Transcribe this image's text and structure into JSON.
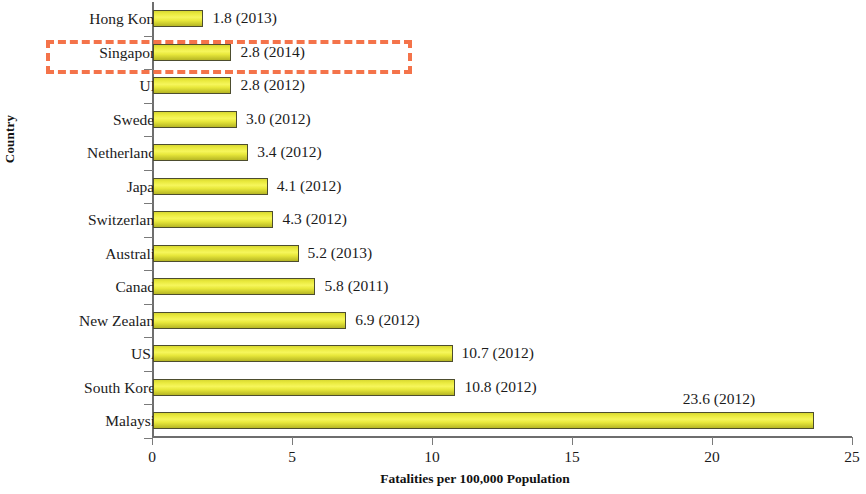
{
  "chart_data": {
    "type": "bar",
    "orientation": "horizontal",
    "title": "",
    "xlabel": "Fatalities per 100,000 Population",
    "ylabel": "Country",
    "xlim": [
      0,
      25
    ],
    "xticks": [
      0,
      5,
      10,
      15,
      20,
      25
    ],
    "xtick_labels": [
      "0",
      "5",
      "10",
      "15",
      "20",
      "25"
    ],
    "grid": false,
    "legend": false,
    "bar_color": "#eaea3e",
    "bar_edge_color": "#4d4d2e",
    "categories": [
      "Hong Kong",
      "Singapore",
      "UK",
      "Sweden",
      "Netherlands",
      "Japan",
      "Switzerland",
      "Australia",
      "Canada",
      "New Zealand",
      "USA",
      "South Korea",
      "Malaysia"
    ],
    "values": [
      1.8,
      2.8,
      2.8,
      3.0,
      3.4,
      4.1,
      4.3,
      5.2,
      5.8,
      6.9,
      10.7,
      10.8,
      23.6
    ],
    "years": [
      2013,
      2014,
      2012,
      2012,
      2012,
      2012,
      2012,
      2013,
      2011,
      2012,
      2012,
      2012,
      2012
    ],
    "data_labels": [
      "1.8 (2013)",
      "2.8 (2014)",
      "2.8 (2012)",
      "3.0 (2012)",
      "3.4 (2012)",
      "4.1 (2012)",
      "4.3 (2012)",
      "5.2 (2013)",
      "5.8 (2011)",
      "6.9 (2012)",
      "10.7 (2012)",
      "10.8 (2012)",
      "23.6 (2012)"
    ],
    "annotations": [
      {
        "type": "highlight-box",
        "target_category": "Singapore",
        "style": "dashed-rectangle",
        "color": "#f4734a"
      }
    ]
  }
}
